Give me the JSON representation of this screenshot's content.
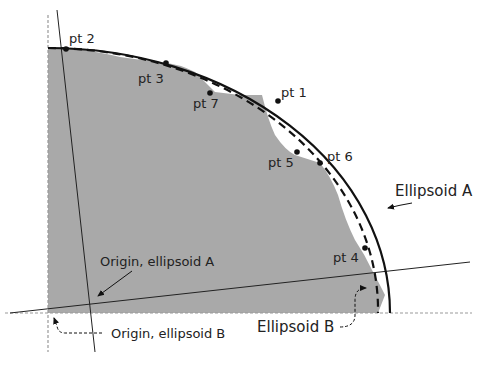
{
  "diagram": {
    "colors": {
      "background": "#ffffff",
      "region_fill": "#a9a9a9",
      "stroke": "#111111",
      "guide": "#999999"
    },
    "points": [
      {
        "label": "pt 1",
        "x": 278,
        "y": 101,
        "lx": 281,
        "ly": 97
      },
      {
        "label": "pt 2",
        "x": 66,
        "y": 49,
        "lx": 69,
        "ly": 43
      },
      {
        "label": "pt 3",
        "x": 166,
        "y": 63,
        "lx": 138,
        "ly": 83
      },
      {
        "label": "pt 4",
        "x": 365,
        "y": 248,
        "lx": 333,
        "ly": 262
      },
      {
        "label": "pt 5",
        "x": 297,
        "y": 152,
        "lx": 268,
        "ly": 167
      },
      {
        "label": "pt 6",
        "x": 320,
        "y": 163,
        "lx": 327,
        "ly": 161
      },
      {
        "label": "pt 7",
        "x": 210,
        "y": 93,
        "lx": 193,
        "ly": 108
      }
    ],
    "labels": {
      "ellipsoid_a": "Ellipsoid A",
      "ellipsoid_b": "Ellipsoid B",
      "origin_a": "Origin, ellipsoid A",
      "origin_b": "Origin, ellipsoid B"
    }
  }
}
